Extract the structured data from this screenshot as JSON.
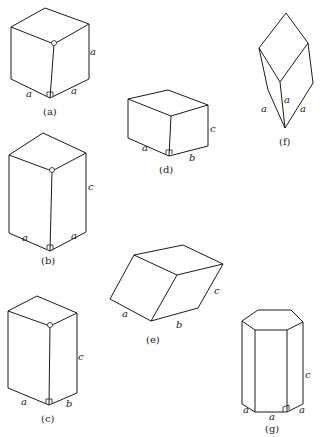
{
  "figure": {
    "panels": [
      {
        "id": "a",
        "caption": "(a)",
        "labels": {
          "vertical": "a",
          "left": "a",
          "right": "a"
        }
      },
      {
        "id": "b",
        "caption": "(b)",
        "labels": {
          "vertical": "c",
          "left": "a",
          "right": "a"
        }
      },
      {
        "id": "c",
        "caption": "(c)",
        "labels": {
          "vertical": "c",
          "left": "a",
          "right": "b"
        }
      },
      {
        "id": "d",
        "caption": "(d)",
        "labels": {
          "vertical": "c",
          "left": "a",
          "right": "b"
        }
      },
      {
        "id": "e",
        "caption": "(e)",
        "labels": {
          "side": "c",
          "left": "a",
          "right": "b"
        }
      },
      {
        "id": "f",
        "caption": "(f)",
        "labels": {
          "left": "a",
          "center": "a",
          "right": "a"
        }
      },
      {
        "id": "g",
        "caption": "(g)",
        "labels": {
          "vertical": "c",
          "left": "a",
          "center": "a",
          "right": "a"
        }
      }
    ]
  },
  "colors": {
    "line": "#1a1a1a",
    "background": "#ffffff"
  }
}
